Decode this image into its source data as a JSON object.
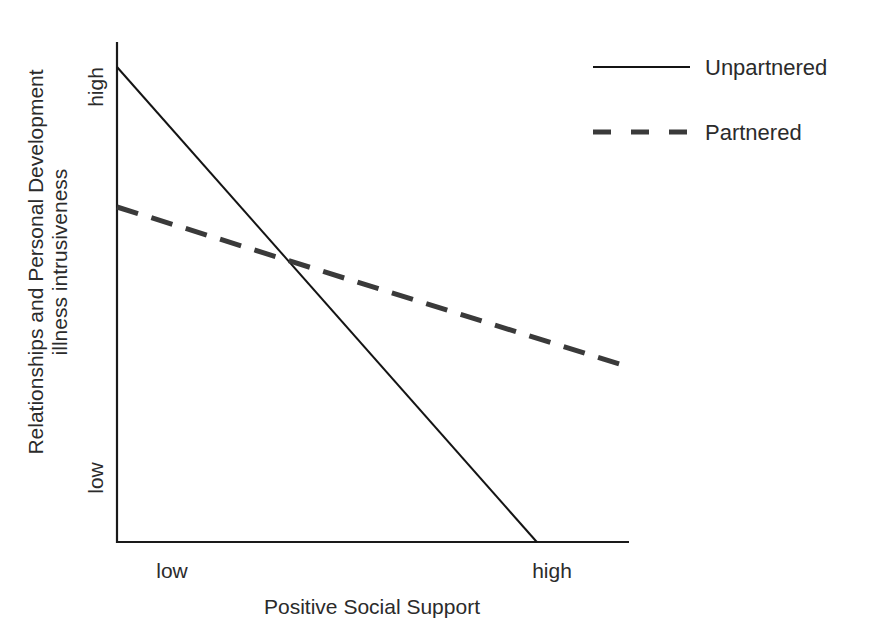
{
  "chart_data": {
    "type": "line",
    "title": "",
    "xlabel": "Positive Social Support",
    "ylabel": [
      "Relationships and Personal Development",
      "illness intrusiveness"
    ],
    "x_ticks": [
      "low",
      "high"
    ],
    "y_ticks": [
      "low",
      "high"
    ],
    "x": [
      "low",
      "high"
    ],
    "xlim": [
      0,
      1
    ],
    "ylim": [
      0,
      1
    ],
    "grid": false,
    "legend_position": "upper right",
    "series": [
      {
        "name": "Unpartnered",
        "style": "solid",
        "color": "#141414",
        "values": [
          0.95,
          0.0
        ],
        "x_end": 0.82,
        "note": "line reaches bottom (low) at x≈0.82 of axis width"
      },
      {
        "name": "Partnered",
        "style": "dashed",
        "color": "#3a3a3a",
        "values": [
          0.67,
          0.35
        ]
      }
    ],
    "annotations": []
  },
  "legend": {
    "items": [
      {
        "label": "Unpartnered",
        "style": "solid"
      },
      {
        "label": "Partnered",
        "style": "dashed"
      }
    ]
  },
  "axes": {
    "x": {
      "title": "Positive Social Support",
      "tick_low": "low",
      "tick_high": "high"
    },
    "y": {
      "title_line1": "Relationships and Personal Development",
      "title_line2": "illness intrusiveness",
      "tick_low": "low",
      "tick_high": "high"
    }
  }
}
